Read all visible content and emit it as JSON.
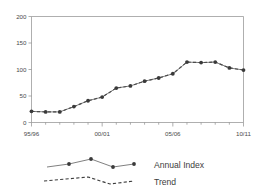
{
  "chart_data": {
    "type": "line",
    "title": "",
    "subtitle": "",
    "xlabel": "",
    "ylabel": "",
    "grid": false,
    "legend_position": "bottom",
    "ylim": [
      0,
      200
    ],
    "yticks": [
      0,
      50,
      100,
      150,
      200
    ],
    "ytick_labels": [
      "0",
      "50",
      "100",
      "150",
      "200"
    ],
    "categories": [
      "95/96",
      "96/97",
      "97/98",
      "98/99",
      "99/00",
      "00/01",
      "01/02",
      "02/03",
      "03/04",
      "04/05",
      "05/06",
      "06/07",
      "07/08",
      "08/09",
      "09/10",
      "10/11"
    ],
    "xtick_labels_shown": [
      "95/96",
      "00/01",
      "05/06",
      "10/11"
    ],
    "xtick_label_positions": [
      0,
      5,
      10,
      15
    ],
    "series": [
      {
        "name": "Annual Index",
        "style": "solid-with-markers",
        "values": [
          21,
          20,
          20,
          30,
          41,
          48,
          65,
          69,
          78,
          84,
          92,
          114,
          113,
          114,
          103,
          99
        ]
      },
      {
        "name": "Trend",
        "style": "dashed",
        "values": [
          21,
          20,
          20,
          30,
          41,
          48,
          65,
          69,
          78,
          84,
          92,
          114,
          113,
          114,
          103,
          99
        ]
      }
    ]
  },
  "legend": {
    "items": [
      {
        "label": "Annual Index",
        "marker": "line-with-points"
      },
      {
        "label": "Trend",
        "marker": "dashed-line"
      }
    ]
  },
  "colors": {
    "axis": "#8d8d8d",
    "line": "#555555",
    "trend": "#3c3c3c",
    "marker": "#3a3a3a",
    "text": "#3d3d3d",
    "background": "#ffffff"
  }
}
